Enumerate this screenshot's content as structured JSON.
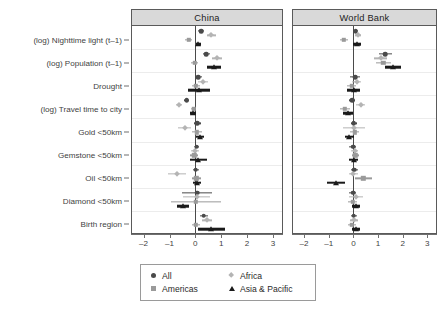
{
  "figure": {
    "type": "coefficient-plot",
    "panels": [
      "China",
      "World Bank"
    ]
  },
  "axis": {
    "xticks": [
      -2,
      -1,
      0,
      1,
      2,
      3
    ],
    "xtick_labels": [
      "–2",
      "–1",
      "0",
      "1",
      "2",
      "3"
    ],
    "xmin": -2.45,
    "xmax": 3.35,
    "zero_reference": 0
  },
  "categories": [
    "(log) Nighttime light (t–1)",
    "(log) Population (t–1)",
    "Drought",
    "(log) Travel time to city",
    "Gold <50km",
    "Gemstone <50km",
    "Oil <50km",
    "Diamond <50km",
    "Birth region"
  ],
  "legend": {
    "rows": [
      [
        {
          "label": "All",
          "marker": "circle",
          "color": "#4a4a4a"
        },
        {
          "label": "Africa",
          "marker": "diamond",
          "color": "#b4b4b4"
        }
      ],
      [
        {
          "label": "Americas",
          "marker": "square",
          "color": "#9a9a9a"
        },
        {
          "label": "Asia & Pacific",
          "marker": "tri",
          "color": "#1a1a1a"
        }
      ]
    ]
  },
  "series_order": [
    "All",
    "Africa",
    "Americas",
    "Asia & Pacific"
  ],
  "series_style": {
    "All": {
      "marker": "circle",
      "color": "#4a4a4a",
      "thick": false
    },
    "Africa": {
      "marker": "diamond",
      "color": "#b4b4b4",
      "thick": false
    },
    "Americas": {
      "marker": "square",
      "color": "#9a9a9a",
      "thick": false
    },
    "Asia & Pacific": {
      "marker": "tri",
      "color": "#1a1a1a",
      "thick": true
    }
  },
  "chart_data": {
    "type": "scatter",
    "title": "",
    "xlabel": "",
    "ylabel": "",
    "xlim": [
      -2.45,
      3.35
    ],
    "grid": true,
    "legend_position": "bottom",
    "categories": [
      "(log) Nighttime light (t–1)",
      "(log) Population (t–1)",
      "Drought",
      "(log) Travel time to city",
      "Gold <50km",
      "Gemstone <50km",
      "Oil <50km",
      "Diamond <50km",
      "Birth region"
    ],
    "panels": [
      {
        "name": "China",
        "series": [
          {
            "name": "All",
            "estimates": [
              0.22,
              0.42,
              0.12,
              -0.34,
              0.07,
              0.05,
              0.02,
              0.07,
              0.33
            ],
            "ci_low": [
              0.1,
              0.29,
              -0.02,
              -0.45,
              -0.06,
              -0.06,
              -0.1,
              -0.5,
              0.19
            ],
            "ci_high": [
              0.34,
              0.55,
              0.26,
              -0.23,
              0.2,
              0.16,
              0.14,
              0.64,
              0.47
            ]
          },
          {
            "name": "Africa",
            "estimates": [
              0.62,
              0.85,
              0.3,
              -0.62,
              -0.42,
              0.0,
              -0.7,
              0.06,
              0.45
            ],
            "ci_low": [
              0.46,
              0.66,
              0.12,
              -0.74,
              -0.66,
              -0.16,
              -1.04,
              -0.46,
              0.24
            ],
            "ci_high": [
              0.78,
              1.04,
              0.48,
              -0.5,
              -0.18,
              0.16,
              -0.36,
              0.58,
              0.66
            ]
          },
          {
            "name": "Americas",
            "estimates": [
              -0.26,
              -0.02,
              0.02,
              -0.06,
              0.06,
              -0.04,
              0.04,
              0.02,
              0.02
            ],
            "ci_low": [
              -0.4,
              -0.16,
              -0.14,
              -0.16,
              -0.12,
              -0.2,
              -0.12,
              -0.94,
              -0.14
            ],
            "ci_high": [
              -0.12,
              0.12,
              0.18,
              0.04,
              0.24,
              0.12,
              0.2,
              0.98,
              0.18
            ]
          },
          {
            "name": "Asia & Pacific",
            "estimates": [
              0.12,
              0.72,
              0.14,
              -0.1,
              0.18,
              0.12,
              0.07,
              -0.48,
              0.62
            ],
            "ci_low": [
              0.02,
              0.46,
              -0.3,
              -0.22,
              0.02,
              -0.2,
              -0.08,
              -0.72,
              0.1
            ],
            "ci_high": [
              0.22,
              0.98,
              0.58,
              0.02,
              0.34,
              0.44,
              0.22,
              -0.24,
              1.14
            ]
          }
        ]
      },
      {
        "name": "World Bank",
        "series": [
          {
            "name": "All",
            "estimates": [
              0.1,
              1.3,
              0.08,
              -0.04,
              0.02,
              -0.02,
              0.04,
              -0.02,
              0.02
            ],
            "ci_low": [
              0.0,
              1.04,
              -0.12,
              -0.16,
              -0.1,
              -0.16,
              -0.1,
              -0.16,
              -0.1
            ],
            "ci_high": [
              0.2,
              1.56,
              0.28,
              0.08,
              0.14,
              0.12,
              0.18,
              0.12,
              0.14
            ]
          },
          {
            "name": "Africa",
            "estimates": [
              0.18,
              1.1,
              0.14,
              0.3,
              0.02,
              0.06,
              0.0,
              0.12,
              0.04
            ],
            "ci_low": [
              0.06,
              0.82,
              -0.04,
              0.12,
              -0.42,
              -0.08,
              -0.18,
              -0.16,
              -0.12
            ],
            "ci_high": [
              0.3,
              1.38,
              0.32,
              0.48,
              0.46,
              0.2,
              0.18,
              0.4,
              0.2
            ]
          },
          {
            "name": "Americas",
            "estimates": [
              -0.38,
              1.22,
              -0.06,
              -0.34,
              0.06,
              0.08,
              0.4,
              -0.02,
              -0.06
            ],
            "ci_low": [
              -0.56,
              0.92,
              -0.24,
              -0.54,
              -0.12,
              -0.06,
              0.06,
              -0.2,
              -0.22
            ],
            "ci_high": [
              -0.2,
              1.52,
              0.12,
              -0.14,
              0.24,
              0.22,
              0.74,
              0.16,
              0.1
            ]
          },
          {
            "name": "Asia & Pacific",
            "estimates": [
              0.16,
              1.62,
              0.02,
              -0.22,
              -0.16,
              0.02,
              -0.7,
              0.1,
              0.12
            ],
            "ci_low": [
              0.0,
              1.3,
              -0.24,
              -0.44,
              -0.36,
              -0.16,
              -1.06,
              -0.06,
              -0.04
            ],
            "ci_high": [
              0.32,
              1.94,
              0.28,
              0.0,
              0.04,
              0.2,
              -0.34,
              0.26,
              0.28
            ]
          }
        ]
      }
    ]
  }
}
